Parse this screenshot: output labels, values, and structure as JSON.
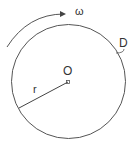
{
  "diagram": {
    "labels": {
      "omega": "ω",
      "disc": "D",
      "center": "O",
      "radius": "r"
    },
    "colors": {
      "stroke": "#555555",
      "text": "#333333",
      "background": "#ffffff"
    },
    "geometry": {
      "circle": {
        "cx": 68.5,
        "cy": 81.5,
        "r": 57
      },
      "center_marker": {
        "x": 68,
        "y": 82
      },
      "radius_end": {
        "x": 19,
        "y": 108
      }
    }
  }
}
